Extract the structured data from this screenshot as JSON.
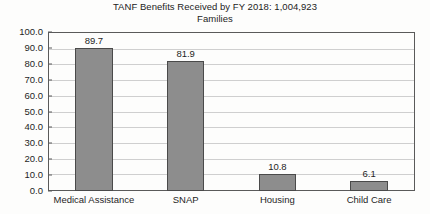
{
  "chart_data": {
    "type": "bar",
    "title": "TANF Benefits Received by FY 2018: 1,004,923 Families",
    "title_lines": [
      "TANF Benefits Received by FY 2018: 1,004,923",
      "Families"
    ],
    "categories": [
      "Medical Assistance",
      "SNAP",
      "Housing",
      "Child Care"
    ],
    "values": [
      89.7,
      81.9,
      10.8,
      6.1
    ],
    "value_labels": [
      "89.7",
      "81.9",
      "10.8",
      "6.1"
    ],
    "xlabel": "",
    "ylabel": "",
    "ylim": [
      0,
      100
    ],
    "ytick_step": 10,
    "ytick_labels": [
      "100.0",
      "90.0",
      "80.0",
      "70.0",
      "60.0",
      "50.0",
      "40.0",
      "30.0",
      "20.0",
      "10.0",
      "0.0"
    ],
    "grid": true,
    "grid_orientation": "horizontal",
    "legend": false,
    "legend_position": "none",
    "bar_color": "#8d8d8d",
    "bar_border_color": "#4a4a4a",
    "gridline_color": "#cfcfcf",
    "axis_color": "#5a5a5a",
    "background_color": "#fdfdfc",
    "text_color": "#1f1f1f"
  }
}
